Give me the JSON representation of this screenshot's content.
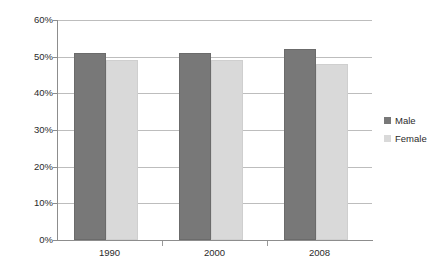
{
  "chart_data": {
    "type": "bar",
    "title": "",
    "subtitle": "",
    "xlabel": "",
    "ylabel": "",
    "categories": [
      "1990",
      "2000",
      "2008"
    ],
    "series": [
      {
        "name": "Male",
        "values": [
          51,
          51,
          52
        ],
        "color": "#787878"
      },
      {
        "name": "Female",
        "values": [
          49,
          49,
          48
        ],
        "color": "#d9d9d9"
      }
    ],
    "ylim": [
      0,
      60
    ],
    "ytick_values": [
      0,
      10,
      20,
      30,
      40,
      50,
      60
    ],
    "ytick_labels": [
      "0%",
      "10%",
      "20%",
      "30%",
      "40%",
      "50%",
      "60%"
    ],
    "value_format": "percent",
    "grid": "horizontal",
    "legend_position": "right",
    "grouping": "clustered",
    "background_color": "#ffffff",
    "axis_color": "#8d8d8d",
    "gridline_color": "#bdbdbd",
    "text_color": "#2b2b2b"
  },
  "axes": {
    "y_ticks": [
      {
        "label": "60%",
        "value": 60
      },
      {
        "label": "50%",
        "value": 50
      },
      {
        "label": "40%",
        "value": 40
      },
      {
        "label": "30%",
        "value": 30
      },
      {
        "label": "20%",
        "value": 20
      },
      {
        "label": "10%",
        "value": 10
      },
      {
        "label": "0%",
        "value": 0
      }
    ],
    "x_categories": [
      {
        "label": "1990"
      },
      {
        "label": "2000"
      },
      {
        "label": "2008"
      }
    ]
  },
  "legend": {
    "entries": [
      {
        "label": "Male",
        "color": "#787878"
      },
      {
        "label": "Female",
        "color": "#d9d9d9"
      }
    ]
  }
}
